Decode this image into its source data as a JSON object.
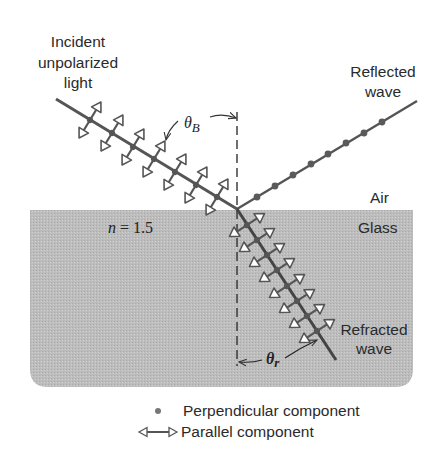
{
  "figure": {
    "labels": {
      "incident_line1": "Incident",
      "incident_line2": "unpolarized",
      "incident_line3": "light",
      "reflected_line1": "Reflected",
      "reflected_line2": "wave",
      "refracted_line1": "Refracted",
      "refracted_line2": "wave",
      "medium_top": "Air",
      "medium_bottom": "Glass",
      "index_var": "n",
      "index_eq": " = 1.5",
      "theta_b_symbol": "θ",
      "theta_b_sub": "B",
      "theta_r_symbol": "θ",
      "theta_r_sub": "r"
    },
    "legend": [
      {
        "symbol": "dot",
        "label": "Perpendicular component"
      },
      {
        "symbol": "double-arrow",
        "label": "Parallel component"
      }
    ],
    "colors": {
      "glass_fill": "#b9b9b9",
      "line": "#555555",
      "dot": "#5a5a5a",
      "text": "#2a2a2a"
    },
    "geometry": {
      "interface_point": [
        237,
        209
      ],
      "incident_start": [
        56,
        99
      ],
      "reflected_end": [
        417,
        101
      ],
      "refracted_end": [
        336,
        360
      ],
      "glass_box": {
        "x": 30,
        "y": 210,
        "w": 383,
        "h": 177,
        "radius": 18
      }
    }
  }
}
